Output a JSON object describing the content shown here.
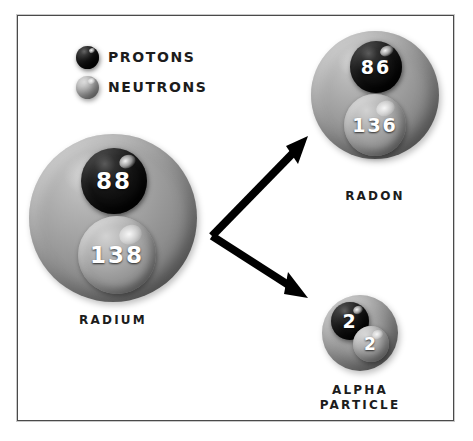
{
  "diagram": {
    "frame_border_color": "#4a4a4a",
    "background_color": "#ffffff"
  },
  "legend": {
    "items": [
      {
        "label": "PROTONS",
        "icon": "dark-sphere-icon",
        "color": "#141414"
      },
      {
        "label": "NEUTRONS",
        "icon": "light-sphere-icon",
        "color": "#a0a0a0"
      }
    ]
  },
  "atoms": [
    {
      "id": "radium",
      "caption": "RADIUM",
      "protons": "88",
      "neutrons": "138"
    },
    {
      "id": "radon",
      "caption": "RADON",
      "protons": "86",
      "neutrons": "136"
    },
    {
      "id": "alpha",
      "caption": "ALPHA\nPARTICLE",
      "protons": "2",
      "neutrons": "2"
    }
  ],
  "arrows": {
    "color": "#000000",
    "upper": {
      "from": "radium",
      "to": "radon",
      "direction": "up-right"
    },
    "lower": {
      "from": "radium",
      "to": "alpha",
      "direction": "down-right"
    }
  }
}
